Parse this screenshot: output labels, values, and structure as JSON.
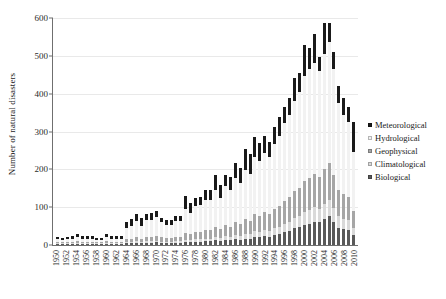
{
  "chart_data": {
    "type": "bar",
    "title": "",
    "subtitle": "",
    "xlabel": "",
    "ylabel": "Number of natural disasters",
    "ylim": [
      0,
      600
    ],
    "yticks": [
      0,
      100,
      200,
      300,
      400,
      500,
      600
    ],
    "grid": true,
    "stacked": true,
    "legend_position": "right",
    "legend": [
      "Meteorological",
      "Hydrological",
      "Geophysical",
      "Climatological",
      "Biological"
    ],
    "colors": {
      "Meteorological": "#1a1a1a",
      "Hydrological": "#f2f2f2",
      "Geophysical": "#a6a6a6",
      "Climatological": "#d9d9d9",
      "Biological": "#595959"
    },
    "x_tick_labels": [
      "1950",
      "1952",
      "1954",
      "1956",
      "1958",
      "1960",
      "1962",
      "1964",
      "1966",
      "1968",
      "1970",
      "1972",
      "1974",
      "1976",
      "1978",
      "1980",
      "1982",
      "1984",
      "1986",
      "1988",
      "1990",
      "1992",
      "1994",
      "1996",
      "1998",
      "2000",
      "2002",
      "2004",
      "2006",
      "2008",
      "2010"
    ],
    "categories": [
      1950,
      1951,
      1952,
      1953,
      1954,
      1955,
      1956,
      1957,
      1958,
      1959,
      1960,
      1961,
      1962,
      1963,
      1964,
      1965,
      1966,
      1967,
      1968,
      1969,
      1970,
      1971,
      1972,
      1973,
      1974,
      1975,
      1976,
      1977,
      1978,
      1979,
      1980,
      1981,
      1982,
      1983,
      1984,
      1985,
      1986,
      1987,
      1988,
      1989,
      1990,
      1991,
      1992,
      1993,
      1994,
      1995,
      1996,
      1997,
      1998,
      1999,
      2000,
      2001,
      2002,
      2003,
      2004,
      2005,
      2006,
      2007,
      2008,
      2009,
      2010
    ],
    "series": [
      {
        "name": "Biological",
        "stack_order": 1,
        "color": "#595959",
        "values": [
          3,
          3,
          3,
          3,
          4,
          3,
          3,
          3,
          3,
          3,
          4,
          3,
          3,
          3,
          5,
          5,
          6,
          5,
          6,
          6,
          7,
          6,
          5,
          5,
          6,
          6,
          8,
          7,
          9,
          9,
          10,
          10,
          12,
          10,
          13,
          12,
          15,
          14,
          17,
          16,
          22,
          20,
          24,
          22,
          26,
          28,
          34,
          38,
          44,
          48,
          52,
          56,
          62,
          60,
          68,
          76,
          60,
          46,
          42,
          40,
          26
        ]
      },
      {
        "name": "Climatological",
        "stack_order": 2,
        "color": "#d9d9d9",
        "values": [
          2,
          2,
          2,
          2,
          2,
          2,
          2,
          2,
          2,
          2,
          2,
          2,
          2,
          2,
          3,
          3,
          4,
          3,
          4,
          4,
          4,
          3,
          3,
          3,
          4,
          4,
          6,
          5,
          6,
          6,
          7,
          7,
          9,
          8,
          10,
          9,
          11,
          10,
          13,
          12,
          15,
          14,
          16,
          15,
          18,
          20,
          22,
          24,
          28,
          30,
          34,
          36,
          38,
          36,
          40,
          42,
          38,
          30,
          28,
          26,
          18
        ]
      },
      {
        "name": "Geophysical",
        "stack_order": 3,
        "color": "#a6a6a6",
        "values": [
          4,
          3,
          4,
          4,
          5,
          4,
          4,
          4,
          3,
          3,
          5,
          4,
          4,
          4,
          8,
          9,
          11,
          9,
          12,
          12,
          14,
          11,
          10,
          10,
          12,
          12,
          18,
          16,
          20,
          20,
          23,
          23,
          28,
          24,
          30,
          28,
          34,
          32,
          38,
          36,
          44,
          42,
          46,
          44,
          50,
          54,
          60,
          64,
          70,
          74,
          82,
          86,
          88,
          84,
          92,
          98,
          86,
          70,
          64,
          60,
          46
        ]
      },
      {
        "name": "Hydrological",
        "stack_order": 4,
        "color": "#f2f2f2",
        "values": [
          8,
          6,
          8,
          8,
          10,
          8,
          8,
          8,
          6,
          6,
          10,
          8,
          8,
          8,
          28,
          34,
          42,
          34,
          44,
          44,
          48,
          40,
          36,
          36,
          42,
          42,
          62,
          56,
          68,
          70,
          78,
          78,
          96,
          82,
          102,
          96,
          116,
          108,
          130,
          124,
          152,
          146,
          158,
          152,
          172,
          186,
          206,
          218,
          238,
          252,
          278,
          288,
          292,
          280,
          306,
          320,
          282,
          230,
          210,
          200,
          156
        ]
      },
      {
        "name": "Meteorological",
        "stack_order": 5,
        "color": "#1a1a1a",
        "values": [
          5,
          5,
          5,
          7,
          8,
          7,
          8,
          7,
          4,
          4,
          8,
          7,
          6,
          6,
          16,
          18,
          20,
          20,
          17,
          18,
          16,
          12,
          12,
          12,
          13,
          14,
          36,
          28,
          22,
          23,
          27,
          28,
          40,
          36,
          30,
          36,
          42,
          40,
          56,
          52,
          52,
          48,
          44,
          40,
          46,
          50,
          42,
          44,
          62,
          52,
          82,
          54,
          78,
          38,
          82,
          50,
          44,
          44,
          44,
          38,
          78
        ]
      }
    ],
    "totals": [
      22,
      19,
      22,
      24,
      29,
      24,
      25,
      24,
      18,
      18,
      29,
      24,
      23,
      23,
      60,
      69,
      83,
      71,
      83,
      84,
      89,
      72,
      66,
      66,
      77,
      78,
      130,
      112,
      125,
      128,
      145,
      146,
      185,
      160,
      185,
      181,
      218,
      204,
      254,
      240,
      285,
      270,
      288,
      273,
      312,
      338,
      364,
      388,
      442,
      456,
      528,
      520,
      558,
      498,
      588,
      586,
      510,
      420,
      388,
      364,
      324
    ]
  }
}
